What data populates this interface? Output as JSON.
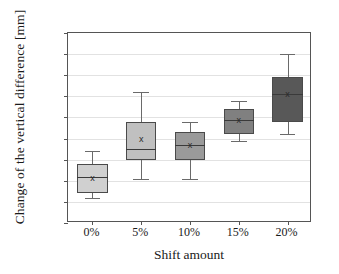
{
  "chart_data": {
    "type": "box",
    "title": "",
    "xlabel": "Shift amount",
    "ylabel": "Change of the vertical difference [mm]",
    "categories": [
      "0%",
      "5%",
      "10%",
      "15%",
      "20%"
    ],
    "ylim": [
      -30,
      60
    ],
    "yticks": [
      60,
      50,
      40,
      30,
      20,
      10,
      0,
      -10,
      -20,
      -30
    ],
    "ytick_labels": [
      "60",
      "50",
      "40",
      "30",
      "20",
      "10",
      "0",
      "-10",
      "-20",
      "-30"
    ],
    "grid": "horizontal",
    "legend": "none",
    "mean_marker": "x",
    "boxes": [
      {
        "category": "0%",
        "whisker_low": -18,
        "q1": -16,
        "median": -8,
        "q3": -2,
        "whisker_high": 4,
        "mean": -8.5,
        "fill": "#d0d0d0"
      },
      {
        "category": "5%",
        "whisker_low": -9,
        "q1": 0,
        "median": 5,
        "q3": 18,
        "whisker_high": 32,
        "mean": 10,
        "fill": "#c0c0c0"
      },
      {
        "category": "10%",
        "whisker_low": -9,
        "q1": 0,
        "median": 7,
        "q3": 13,
        "whisker_high": 18,
        "mean": 7,
        "fill": "#9a9a9a"
      },
      {
        "category": "15%",
        "whisker_low": 9,
        "q1": 12,
        "median": 19,
        "q3": 24,
        "whisker_high": 28,
        "mean": 19,
        "fill": "#808080"
      },
      {
        "category": "20%",
        "whisker_low": 12,
        "q1": 18,
        "median": 31,
        "q3": 39,
        "whisker_high": 50,
        "mean": 31,
        "fill": "#585858"
      }
    ]
  },
  "colors": {
    "frame": "#555555",
    "grid": "#e2e2e2",
    "box_border": "#4a4a4a",
    "whisker": "#6a6a6a",
    "text": "#1a1a1a"
  }
}
